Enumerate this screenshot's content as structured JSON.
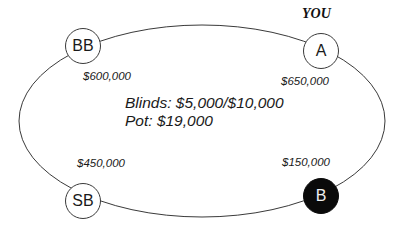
{
  "diagram": {
    "type": "poker-table",
    "table": {
      "shape": "ellipse",
      "cx": 202,
      "cy": 121,
      "rx": 183,
      "ry": 96,
      "stroke": "#3a3a3a"
    },
    "hero_label": "YOU",
    "center": {
      "blinds": "Blinds: $5,000/$10,000",
      "pot": "Pot: $19,000"
    },
    "seats": [
      {
        "id": "BB",
        "label": "BB",
        "stack": "$600,000",
        "highlighted": false,
        "is_hero": false
      },
      {
        "id": "A",
        "label": "A",
        "stack": "$650,000",
        "highlighted": false,
        "is_hero": true
      },
      {
        "id": "SB",
        "label": "SB",
        "stack": "$450,000",
        "highlighted": false,
        "is_hero": false
      },
      {
        "id": "B",
        "label": "B",
        "stack": "$150,000",
        "highlighted": true,
        "is_hero": false
      }
    ],
    "colors": {
      "line": "#3a3a3a",
      "seat_fill": "#ffffff",
      "highlight_fill": "#0a0a0a",
      "highlight_text": "#f0f0f0",
      "text": "#1a1a1a"
    }
  }
}
